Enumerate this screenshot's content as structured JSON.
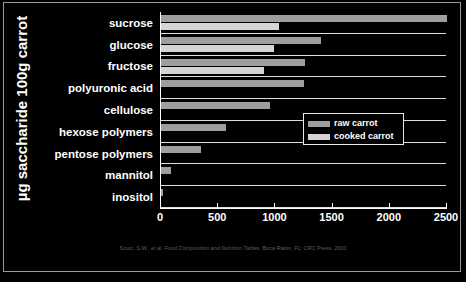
{
  "chart_data": {
    "type": "bar",
    "orientation": "horizontal",
    "title": "",
    "subtitle": "",
    "xlabel": "",
    "ylabel": "µg saccharide 100g carrot",
    "xlim": [
      0,
      2500
    ],
    "grid": false,
    "legend_position": "middle-right",
    "categories": [
      "sucrose",
      "glucose",
      "fructose",
      "polyuronic acid",
      "cellulose",
      "hexose polymers",
      "pentose polymers",
      "mannitol",
      "inositol"
    ],
    "series": [
      {
        "name": "raw carrot",
        "color": "#9e9e9e",
        "values": [
          2500,
          1400,
          1260,
          1250,
          950,
          570,
          350,
          90,
          20
        ]
      },
      {
        "name": "cooked carrot",
        "color": "#d4d4d4",
        "values": [
          1030,
          990,
          900,
          0,
          0,
          0,
          0,
          0,
          0
        ]
      }
    ],
    "xticks": [
      0,
      500,
      1000,
      1500,
      2000,
      2500
    ],
    "xtick_labels": [
      "0",
      "500",
      "1000",
      "1500",
      "2000",
      "2500"
    ]
  },
  "legend": {
    "items": [
      {
        "label": "raw carrot",
        "color": "#9e9e9e"
      },
      {
        "label": "cooked carrot",
        "color": "#d4d4d4"
      }
    ]
  },
  "caption": {
    "prefix": "Souci, S.W., et al. ",
    "italic": "Food Composition and Nutrition Tables",
    "suffix": ". Boca Raton, FL: CRC Press, 2000"
  }
}
